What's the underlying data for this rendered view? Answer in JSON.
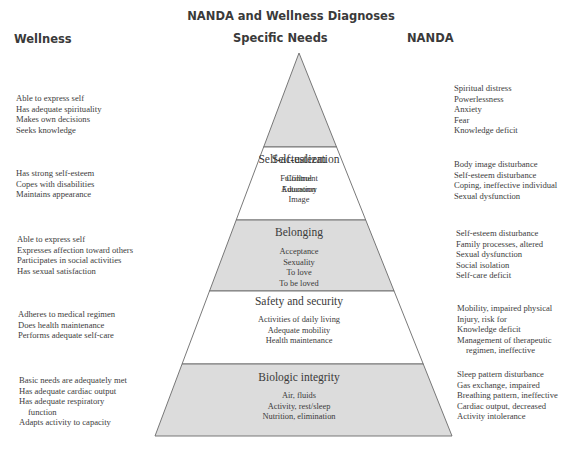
{
  "title": "NANDA and Wellness Diagnoses",
  "columns": {
    "wellness": "Wellness",
    "needs": "Specific Needs",
    "nanda": "NANDA"
  },
  "colors": {
    "shaded_fill": "#dcdcdc",
    "plain_fill": "#ffffff",
    "outline": "#6a6a6a"
  },
  "levels": [
    {
      "name": "Self-actualization",
      "shaded": true,
      "needs": [
        "Fulfillment",
        "Education"
      ],
      "wellness": [
        "Able to express self",
        "Has adequate spirituality",
        "Makes own decisions",
        "Seeks knowledge"
      ],
      "nanda": [
        "Spiritual distress",
        "Powerlessness",
        "Anxiety",
        "Fear",
        "Knowledge deficit"
      ]
    },
    {
      "name": "Self-esteem",
      "shaded": false,
      "needs": [
        "Control",
        "Autonomy",
        "Image"
      ],
      "wellness": [
        "Has strong self-esteem",
        "Copes with disabilities",
        "Maintains appearance"
      ],
      "nanda": [
        "Body image disturbance",
        "Self-esteem disturbance",
        "Coping, ineffective individual",
        "Sexual dysfunction"
      ]
    },
    {
      "name": "Belonging",
      "shaded": true,
      "needs": [
        "Acceptance",
        "Sexuality",
        "To love",
        "To be loved"
      ],
      "wellness": [
        "Able to express self",
        "Expresses affection toward others",
        "Participates in social activities",
        "Has sexual satisfaction"
      ],
      "nanda": [
        "Self-esteem disturbance",
        "Family processes, altered",
        "Sexual dysfunction",
        "Social isolation",
        "Self-care deficit"
      ]
    },
    {
      "name": "Safety and security",
      "shaded": false,
      "needs": [
        "Activities of daily living",
        "Adequate mobility",
        "Health maintenance"
      ],
      "wellness": [
        "Adheres to medical regimen",
        "Does health maintenance",
        "Performs adequate self-care"
      ],
      "nanda": [
        "Mobility, impaired physical",
        "Injury, risk for",
        "Knowledge deficit",
        "Management of therapeutic",
        "regimen, ineffective"
      ]
    },
    {
      "name": "Biologic integrity",
      "shaded": true,
      "needs": [
        "Air, fluids",
        "Activity, rest/sleep",
        "Nutrition, elimination"
      ],
      "wellness": [
        "Basic needs are adequately met",
        "Has adequate cardiac output",
        "Has adequate respiratory",
        "function",
        "Adapts activity to capacity"
      ],
      "nanda": [
        "Sleep pattern disturbance",
        "Gas exchange, impaired",
        "Breathing pattern, ineffective",
        "Cardiac output, decreased",
        "Activity intolerance"
      ]
    }
  ]
}
